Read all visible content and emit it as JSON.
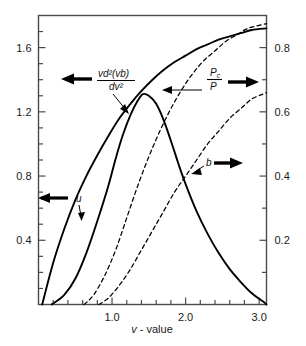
{
  "chart_data": {
    "type": "line",
    "title": "",
    "xlabel": "v - value",
    "ylabel_left": "",
    "ylabel_right": "",
    "xlim": [
      0.0,
      3.1
    ],
    "ylim_left": [
      0.0,
      1.8
    ],
    "ylim_right": [
      0.0,
      0.9
    ],
    "grid": false,
    "legend": "inline-annotations",
    "x_ticks_major": [
      "1.0",
      "2.0",
      "3.0"
    ],
    "x_tick_major_values": [
      1.0,
      2.0,
      3.0
    ],
    "x_tick_minor_step": 0.2,
    "y_left_ticks_major": [
      "0.4",
      "0.8",
      "1.2",
      "1.6"
    ],
    "y_left_tick_major_values": [
      0.4,
      0.8,
      1.2,
      1.6
    ],
    "y_left_tick_minor_step": 0.1,
    "y_right_ticks_major": [
      "0.2",
      "0.4",
      "0.6",
      "0.8"
    ],
    "y_right_tick_major_values": [
      0.2,
      0.4,
      0.6,
      0.8
    ],
    "y_right_tick_minor_step": 0.1,
    "series": [
      {
        "name": "u",
        "label": "u",
        "style": "solid",
        "axis": "left",
        "arrow": "left",
        "color": "#000000",
        "points": [
          [
            0.05,
            0.0
          ],
          [
            0.2,
            0.26
          ],
          [
            0.35,
            0.47
          ],
          [
            0.5,
            0.65
          ],
          [
            0.65,
            0.8
          ],
          [
            0.8,
            0.93
          ],
          [
            0.95,
            1.05
          ],
          [
            1.1,
            1.16
          ],
          [
            1.25,
            1.25
          ],
          [
            1.4,
            1.33
          ],
          [
            1.55,
            1.4
          ],
          [
            1.7,
            1.46
          ],
          [
            1.85,
            1.51
          ],
          [
            2.0,
            1.55
          ],
          [
            2.15,
            1.59
          ],
          [
            2.3,
            1.62
          ],
          [
            2.45,
            1.65
          ],
          [
            2.6,
            1.67
          ],
          [
            2.75,
            1.69
          ],
          [
            2.9,
            1.71
          ],
          [
            3.1,
            1.72
          ]
        ]
      },
      {
        "name": "vd2vb-dv2",
        "label_numerator": "vd²(vb)",
        "label_denominator": "dv²",
        "style": "solid",
        "axis": "left",
        "arrow": "left",
        "color": "#000000",
        "points": [
          [
            0.18,
            0.0
          ],
          [
            0.35,
            0.06
          ],
          [
            0.5,
            0.16
          ],
          [
            0.65,
            0.32
          ],
          [
            0.8,
            0.52
          ],
          [
            0.95,
            0.74
          ],
          [
            1.05,
            0.91
          ],
          [
            1.15,
            1.06
          ],
          [
            1.25,
            1.18
          ],
          [
            1.35,
            1.27
          ],
          [
            1.42,
            1.31
          ],
          [
            1.5,
            1.3
          ],
          [
            1.6,
            1.25
          ],
          [
            1.7,
            1.15
          ],
          [
            1.8,
            1.02
          ],
          [
            1.9,
            0.88
          ],
          [
            2.0,
            0.75
          ],
          [
            2.15,
            0.58
          ],
          [
            2.3,
            0.44
          ],
          [
            2.45,
            0.32
          ],
          [
            2.6,
            0.22
          ],
          [
            2.75,
            0.14
          ],
          [
            2.9,
            0.07
          ],
          [
            3.05,
            0.02
          ],
          [
            3.1,
            0.0
          ]
        ]
      },
      {
        "name": "Pc-over-P",
        "label_numerator": "Pc",
        "label_denominator": "P",
        "style": "dashed",
        "axis": "right",
        "arrow": "right",
        "color": "#000000",
        "points": [
          [
            0.62,
            0.0
          ],
          [
            0.75,
            0.03
          ],
          [
            0.9,
            0.09
          ],
          [
            1.05,
            0.17
          ],
          [
            1.2,
            0.27
          ],
          [
            1.35,
            0.37
          ],
          [
            1.5,
            0.46
          ],
          [
            1.65,
            0.54
          ],
          [
            1.8,
            0.61
          ],
          [
            1.95,
            0.67
          ],
          [
            2.1,
            0.72
          ],
          [
            2.25,
            0.76
          ],
          [
            2.4,
            0.79
          ],
          [
            2.55,
            0.82
          ],
          [
            2.7,
            0.84
          ],
          [
            2.85,
            0.86
          ],
          [
            3.1,
            0.875
          ]
        ]
      },
      {
        "name": "b",
        "label": "b",
        "style": "dashed",
        "axis": "right",
        "arrow": "right",
        "color": "#000000",
        "points": [
          [
            0.82,
            0.0
          ],
          [
            0.95,
            0.02
          ],
          [
            1.1,
            0.06
          ],
          [
            1.25,
            0.11
          ],
          [
            1.4,
            0.17
          ],
          [
            1.55,
            0.23
          ],
          [
            1.7,
            0.29
          ],
          [
            1.85,
            0.35
          ],
          [
            2.0,
            0.4
          ],
          [
            2.15,
            0.45
          ],
          [
            2.3,
            0.5
          ],
          [
            2.45,
            0.54
          ],
          [
            2.6,
            0.58
          ],
          [
            2.75,
            0.61
          ],
          [
            2.9,
            0.64
          ],
          [
            3.05,
            0.655
          ],
          [
            3.1,
            0.66
          ]
        ]
      }
    ],
    "annotations": [
      {
        "id": "ann-u",
        "text": "u",
        "arrow": "left",
        "x": 0.55,
        "y_left": 0.8
      },
      {
        "id": "ann-second-derivative",
        "numerator": "vd²(vb)",
        "denominator": "dv²",
        "arrow": "left",
        "x": 0.95,
        "y_left": 1.46
      },
      {
        "id": "ann-pc-p",
        "numerator": "Pc",
        "denominator": "P",
        "arrow": "right",
        "x": 2.45,
        "y_right": 0.745
      },
      {
        "id": "ann-b",
        "text": "b",
        "arrow": "right",
        "x": 2.35,
        "y_right": 0.425
      }
    ],
    "axis_label_x": "v - value",
    "axis_label_x_italic_part": "v",
    "axis_label_x_rest": "- value"
  },
  "figure": {
    "background_color": "#ffffff",
    "line_color": "#000000",
    "frame_color": "#3a3a3a"
  }
}
